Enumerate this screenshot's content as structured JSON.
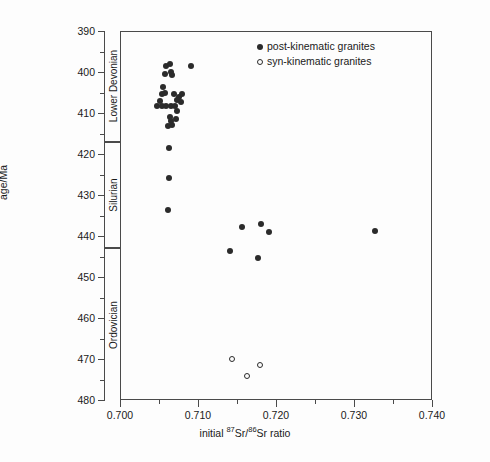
{
  "chart_data": {
    "type": "scatter",
    "title": "",
    "xlabel": "initial 87Sr/86Sr ratio",
    "xlabel_parts": {
      "prefix": "initial ",
      "sup1": "87",
      "mid": "Sr/",
      "sup2": "86",
      "suffix": "Sr ratio"
    },
    "ylabel": "age/Ma",
    "xlim": [
      0.7,
      0.74
    ],
    "ylim": [
      480,
      390
    ],
    "y_inverted": true,
    "grid": false,
    "legend_position": "top-right-inside",
    "xticks": [
      0.7,
      0.71,
      0.72,
      0.73,
      0.74
    ],
    "xtick_labels": [
      "0.700",
      "0.710",
      "0.720",
      "0.730",
      "0.740"
    ],
    "xminor_ticks": [
      0.705,
      0.715,
      0.725,
      0.735
    ],
    "yticks": [
      390,
      400,
      410,
      420,
      430,
      440,
      450,
      460,
      470,
      480
    ],
    "ytick_labels": [
      "390",
      "400",
      "410",
      "420",
      "430",
      "440",
      "450",
      "460",
      "470",
      "480"
    ],
    "yminor_ticks": [
      395,
      405,
      415,
      425,
      435,
      445,
      455,
      465,
      475
    ],
    "strat_bands": [
      {
        "name": "Lower Devonian",
        "top": 390,
        "bottom": 417
      },
      {
        "name": "Silurian",
        "top": 417,
        "bottom": 443
      },
      {
        "name": "Ordovician",
        "top": 443,
        "bottom": 480
      }
    ],
    "series": [
      {
        "name": "post-kinematic granites",
        "marker": "filled-circle",
        "color": "#2b2b2b",
        "points": [
          [
            0.7058,
            398.3
          ],
          [
            0.7063,
            397.8
          ],
          [
            0.709,
            398.2
          ],
          [
            0.7056,
            400.3
          ],
          [
            0.7064,
            399.8
          ],
          [
            0.7066,
            400.4
          ],
          [
            0.7054,
            403.4
          ],
          [
            0.7052,
            405.2
          ],
          [
            0.7057,
            404.9
          ],
          [
            0.7068,
            405.2
          ],
          [
            0.7074,
            405.8
          ],
          [
            0.7078,
            405.2
          ],
          [
            0.705,
            406.8
          ],
          [
            0.7072,
            406.6
          ],
          [
            0.7046,
            408.0
          ],
          [
            0.7052,
            408.0
          ],
          [
            0.7058,
            408.0
          ],
          [
            0.7064,
            408.0
          ],
          [
            0.7069,
            408.0
          ],
          [
            0.7077,
            407.1
          ],
          [
            0.7072,
            409.3
          ],
          [
            0.7063,
            410.8
          ],
          [
            0.7064,
            411.6
          ],
          [
            0.7071,
            411.2
          ],
          [
            0.706,
            413.0
          ],
          [
            0.7066,
            412.6
          ],
          [
            0.7061,
            418.3
          ],
          [
            0.7061,
            425.6
          ],
          [
            0.706,
            433.5
          ],
          [
            0.718,
            436.8
          ],
          [
            0.7155,
            437.5
          ],
          [
            0.719,
            438.9
          ],
          [
            0.7325,
            438.6
          ],
          [
            0.714,
            443.5
          ],
          [
            0.7175,
            445.0
          ]
        ]
      },
      {
        "name": "syn-kinematic granites",
        "marker": "open-circle",
        "color": "#2b2b2b",
        "points": [
          [
            0.7142,
            469.8
          ],
          [
            0.7178,
            471.2
          ],
          [
            0.7162,
            474.0
          ]
        ]
      }
    ]
  },
  "legend": {
    "entries": [
      {
        "label": "post-kinematic granites",
        "marker": "filled"
      },
      {
        "label": "syn-kinematic granites",
        "marker": "open"
      }
    ]
  },
  "axes": {
    "y_title": "age/Ma"
  },
  "colors": {
    "marker": "#2b2b2b",
    "axis": "#4a4a4a",
    "background": "#fdfdfd"
  }
}
